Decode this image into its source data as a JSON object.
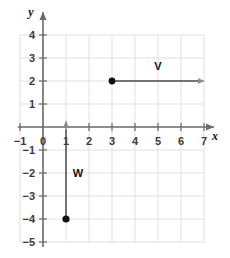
{
  "chart_data": {
    "type": "scatter",
    "title": "",
    "xlabel": "x",
    "ylabel": "y",
    "xlim": [
      -1,
      7
    ],
    "ylim": [
      -5,
      4
    ],
    "grid": true,
    "legend": "none",
    "x_ticks": [
      "-1",
      "0",
      "1",
      "2",
      "3",
      "4",
      "5",
      "6",
      "7"
    ],
    "x_tick_values": [
      -1,
      0,
      1,
      2,
      3,
      4,
      5,
      6,
      7
    ],
    "y_ticks": [
      "4",
      "3",
      "2",
      "1",
      "-1",
      "-2",
      "-3",
      "-4",
      "-5"
    ],
    "y_tick_values": [
      4,
      3,
      2,
      1,
      -1,
      -2,
      -3,
      -4,
      -5
    ],
    "vectors": [
      {
        "name": "v",
        "label": "V",
        "tail": [
          3,
          2
        ],
        "head": [
          6.8,
          2
        ],
        "label_pos": [
          5,
          2.5
        ],
        "dot_at_tail": true,
        "orientation": "horizontal-right"
      },
      {
        "name": "w",
        "label": "W",
        "tail": [
          1,
          -4
        ],
        "head": [
          1,
          0
        ],
        "label_pos": [
          1.35,
          -2
        ],
        "dot_at_tail": true,
        "orientation": "vertical-up"
      }
    ],
    "points": [
      {
        "x": 3,
        "y": 2,
        "style": "filled-circle"
      },
      {
        "x": 1,
        "y": -4,
        "style": "filled-circle"
      }
    ],
    "colors": {
      "grid": "#d9d9d9",
      "axis": "#6b6b6b",
      "vector": "#4a4a4a",
      "point": "#111111",
      "text": "#3b3b3b",
      "background": "#ffffff"
    }
  },
  "axes": {
    "x_name": "x",
    "y_name": "y"
  },
  "tick_labels": {
    "x": [
      "-1",
      "0",
      "1",
      "2",
      "3",
      "4",
      "5",
      "6",
      "7"
    ],
    "y": [
      "4",
      "3",
      "2",
      "1",
      "-1",
      "-2",
      "-3",
      "-4",
      "-5"
    ]
  },
  "vector_labels": {
    "v": "V",
    "w": "W"
  }
}
